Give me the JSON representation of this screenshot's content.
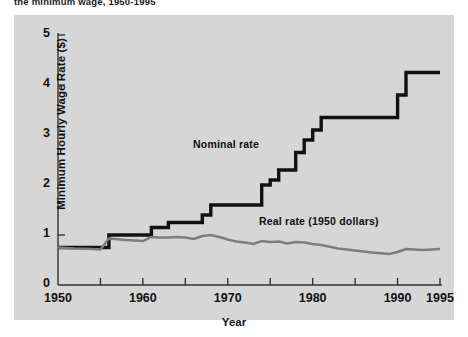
{
  "caption": "the minimum wage, 1950-1995",
  "colors": {
    "panel": "#d6d6d6",
    "page": "#ffffff",
    "axis": "#333333",
    "nominal": "#111111",
    "real": "#7d7d7d",
    "text": "#111111"
  },
  "axis": {
    "ylabel": "Minimum Hourly Wage Rate ($)",
    "xlabel": "Year",
    "yticks": [
      "0",
      "1",
      "2",
      "3",
      "4",
      "5"
    ],
    "xticks": [
      "1950",
      "1960",
      "1970",
      "1980",
      "1990",
      "1995"
    ]
  },
  "annotations": {
    "nominal": "Nominal rate",
    "real": "Real rate (1950 dollars)"
  },
  "chart_data": {
    "type": "line",
    "title": "the minimum wage, 1950-1995",
    "xlabel": "Year",
    "ylabel": "Minimum Hourly Wage Rate ($)",
    "xlim": [
      1950,
      1995
    ],
    "ylim": [
      0,
      5
    ],
    "ytick_values": [
      0,
      1,
      2,
      3,
      4,
      5
    ],
    "xtick_values": [
      1950,
      1960,
      1970,
      1980,
      1990,
      1995
    ],
    "minor_xticks_every": 5,
    "grid": false,
    "legend": "inline-annotations",
    "series": [
      {
        "name": "Nominal rate",
        "style": "step",
        "color": "#111111",
        "x": [
          1950,
          1955,
          1956,
          1960,
          1961,
          1962,
          1963,
          1966,
          1967,
          1968,
          1973,
          1974,
          1975,
          1976,
          1977,
          1978,
          1979,
          1980,
          1981,
          1989,
          1990,
          1991,
          1995
        ],
        "y": [
          0.75,
          0.75,
          1.0,
          1.0,
          1.15,
          1.15,
          1.25,
          1.25,
          1.4,
          1.6,
          1.6,
          2.0,
          2.1,
          2.3,
          2.3,
          2.65,
          2.9,
          3.1,
          3.35,
          3.35,
          3.8,
          4.25,
          4.25
        ]
      },
      {
        "name": "Real rate (1950 dollars)",
        "style": "line",
        "color": "#7d7d7d",
        "x": [
          1950,
          1952,
          1954,
          1955,
          1956,
          1958,
          1960,
          1961,
          1962,
          1963,
          1964,
          1965,
          1966,
          1967,
          1968,
          1969,
          1970,
          1971,
          1972,
          1973,
          1974,
          1975,
          1976,
          1977,
          1978,
          1979,
          1980,
          1981,
          1983,
          1985,
          1987,
          1989,
          1990,
          1991,
          1993,
          1995
        ],
        "y": [
          0.75,
          0.73,
          0.72,
          0.71,
          0.93,
          0.9,
          0.88,
          0.96,
          0.95,
          0.95,
          0.96,
          0.95,
          0.92,
          0.98,
          1.0,
          0.96,
          0.91,
          0.87,
          0.85,
          0.82,
          0.88,
          0.86,
          0.87,
          0.83,
          0.86,
          0.85,
          0.82,
          0.8,
          0.73,
          0.69,
          0.65,
          0.62,
          0.66,
          0.72,
          0.7,
          0.72
        ]
      }
    ]
  }
}
